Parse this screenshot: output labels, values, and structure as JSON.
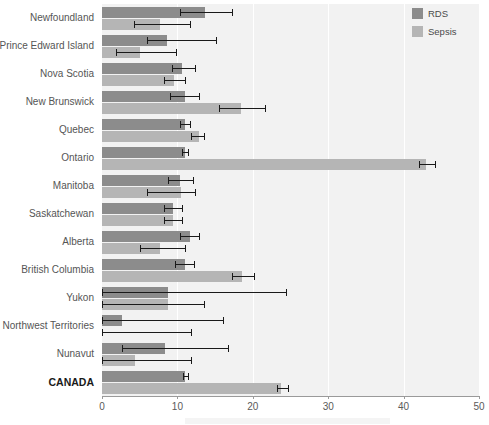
{
  "legend": {
    "position": "top-right",
    "items": [
      {
        "label": "RDS",
        "color": "#8c8c8c",
        "icon": "square-swatch-icon"
      },
      {
        "label": "Sepsis",
        "color": "#b5b5b5",
        "icon": "square-swatch-icon"
      }
    ]
  },
  "axis": {
    "ticks": [
      "0",
      "10",
      "20",
      "30",
      "40",
      "50"
    ],
    "tick_values": [
      0,
      10,
      20,
      30,
      40,
      50
    ],
    "min": 0,
    "max": 50
  },
  "chart_data": {
    "type": "bar",
    "orientation": "horizontal",
    "title": "",
    "xlabel": "",
    "ylabel": "",
    "xlim": [
      0,
      50
    ],
    "grid": true,
    "grid_axis": "x",
    "legend_position": "top-right",
    "error_bars": "95% confidence interval",
    "categories": [
      "Newfoundland",
      "Prince Edward Island",
      "Nova Scotia",
      "New Brunswick",
      "Quebec",
      "Ontario",
      "Manitoba",
      "Saskatchewan",
      "Alberta",
      "British Columbia",
      "Yukon",
      "Northwest Territories",
      "Nunavut",
      "CANADA"
    ],
    "emphasis_category": "CANADA",
    "series": [
      {
        "name": "RDS",
        "color": "#8c8c8c",
        "values": [
          13.7,
          8.6,
          10.6,
          11.0,
          11.0,
          11.0,
          10.4,
          9.4,
          11.7,
          11.0,
          8.8,
          2.7,
          8.4,
          11.0
        ],
        "ci_low": [
          10.3,
          6.0,
          9.3,
          9.0,
          10.4,
          10.6,
          8.8,
          8.2,
          10.4,
          9.7,
          0.0,
          0.0,
          2.6,
          10.8
        ],
        "ci_high": [
          17.4,
          15.2,
          12.5,
          13.0,
          11.8,
          11.5,
          12.2,
          10.7,
          13.0,
          12.3,
          24.5,
          16.2,
          16.8,
          11.6
        ]
      },
      {
        "name": "Sepsis",
        "color": "#b5b5b5",
        "values": [
          7.7,
          5.0,
          9.5,
          18.4,
          12.8,
          43.0,
          10.5,
          9.4,
          7.7,
          18.6,
          8.8,
          0.0,
          4.4,
          23.8
        ],
        "ci_low": [
          4.2,
          1.9,
          8.2,
          15.5,
          11.8,
          42.0,
          6.0,
          8.2,
          5.0,
          17.2,
          0.0,
          0.0,
          0.0,
          23.2
        ],
        "ci_high": [
          11.8,
          9.9,
          11.2,
          21.7,
          13.6,
          44.3,
          12.5,
          10.8,
          11.2,
          20.3,
          13.7,
          12.0,
          12.0,
          24.8
        ]
      }
    ]
  }
}
